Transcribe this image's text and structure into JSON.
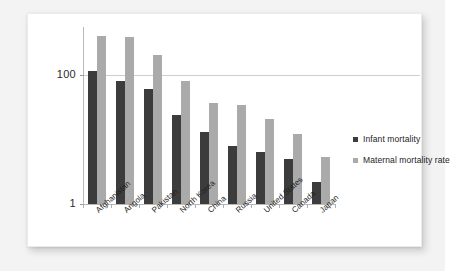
{
  "chart_data": {
    "type": "bar",
    "title": "",
    "xlabel": "",
    "ylabel": "",
    "yscale": "log",
    "ylim": [
      1,
      400
    ],
    "ytick_labels": [
      "100",
      "1"
    ],
    "ytick_values": [
      100,
      1
    ],
    "grid": true,
    "legend_position": "right",
    "categories": [
      "Afghanistan",
      "Angola",
      "Pakistan",
      "North Korea",
      "China",
      "Russia",
      "United States",
      "Canada",
      "Japan"
    ],
    "series": [
      {
        "name": "Infant mortality",
        "color": "#3c3c3c",
        "values": [
          115,
          79,
          61,
          24,
          13,
          8,
          6.5,
          5,
          2.2
        ]
      },
      {
        "name": "Maternal mortality rate",
        "color": "#aaaaaa",
        "values": [
          400,
          390,
          200,
          81,
          37,
          34,
          21,
          12,
          5.4
        ]
      }
    ]
  },
  "legend": {
    "items": [
      {
        "label": "Infant mortality",
        "color": "#3c3c3c"
      },
      {
        "label": "Maternal mortality rate",
        "color": "#aaaaaa"
      }
    ]
  },
  "colors": {
    "infant": "#3c3c3c",
    "maternal": "#aaaaaa",
    "axis": "#b9b9b9",
    "grid": "#cfcfcf",
    "card": "#ffffff",
    "page": "#f3f3f3"
  }
}
